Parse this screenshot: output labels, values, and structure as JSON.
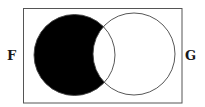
{
  "diagram": {
    "type": "venn",
    "universe": {
      "x": 23,
      "y": 8,
      "width": 159,
      "height": 95,
      "stroke": "#555555"
    },
    "sets": [
      {
        "id": "F",
        "label": "F",
        "cx": 74.5,
        "cy": 55,
        "r": 40.5
      },
      {
        "id": "G",
        "label": "G",
        "cx": 134,
        "cy": 54,
        "r": 41
      }
    ],
    "shaded_region": "F minus G",
    "shade_color": "#000000",
    "outline_color": "#444444"
  },
  "labels": {
    "left": "F",
    "right": "G"
  }
}
